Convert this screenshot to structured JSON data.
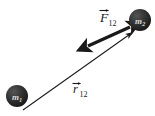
{
  "figure": {
    "kind": "physics-force-diagram",
    "background_color": "#ffffff",
    "ink_color": "#1a1a1a",
    "sphere_fill_color": "#2b2b2b",
    "sphere_label_color": "#d9d9d9"
  },
  "bodies": [
    {
      "id": "mass-1",
      "symbol": "m",
      "subscript": "1",
      "position": "lower-left",
      "cx": 17,
      "cy": 96,
      "r": 11
    },
    {
      "id": "mass-2",
      "symbol": "m",
      "subscript": "2",
      "position": "upper-right",
      "cx": 140,
      "cy": 20,
      "r": 11
    }
  ],
  "vectors": [
    {
      "id": "force-vector",
      "symbol": "F",
      "subscript": "12",
      "accent": "arrow-overbar",
      "style": "double-headed",
      "thickness": "thick",
      "direction": "down-left",
      "label_x": 103,
      "label_y": 21,
      "x1": 131,
      "y1": 27,
      "x2": 86,
      "y2": 47
    },
    {
      "id": "separation-vector",
      "symbol": "r",
      "subscript": "12",
      "accent": "arrow-overbar",
      "style": "single-headed",
      "thickness": "thin",
      "direction": "up-right",
      "label_x": 75,
      "label_y": 93,
      "x1": 23,
      "y1": 110,
      "x2": 134,
      "y2": 32
    }
  ]
}
